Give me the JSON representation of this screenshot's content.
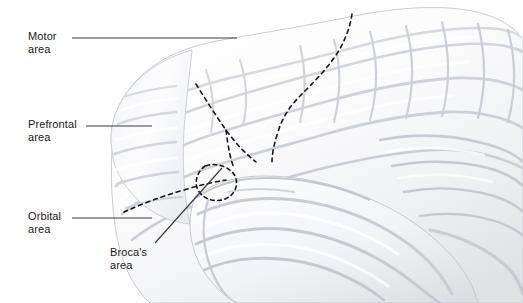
{
  "figure": {
    "background_color": "#ffffff",
    "width": 523,
    "height": 303
  },
  "labels": [
    {
      "id": "motor",
      "name": "motor-area",
      "line1": "Motor",
      "line2": "area",
      "text": "Motor\narea",
      "leader": {
        "type": "horizontal",
        "x1": 72,
        "y1": 38,
        "x2": 237,
        "y2": 38
      }
    },
    {
      "id": "prefrontal",
      "name": "prefrontal-area",
      "line1": "Prefrontal",
      "line2": "area",
      "text": "Prefrontal\narea",
      "leader": {
        "type": "horizontal",
        "x1": 86,
        "y1": 126,
        "x2": 152,
        "y2": 126
      }
    },
    {
      "id": "orbital",
      "name": "orbital-area",
      "line1": "Orbital",
      "line2": "area",
      "text": "Orbital\narea",
      "leader": {
        "type": "horizontal",
        "x1": 72,
        "y1": 218,
        "x2": 152,
        "y2": 218
      }
    },
    {
      "id": "brocas",
      "name": "brocas-area",
      "line1": "Broca's",
      "line2": "area",
      "text": "Broca's\narea",
      "leader": {
        "type": "diagonal",
        "x1": 155,
        "y1": 243,
        "x2": 222,
        "y2": 168
      }
    }
  ],
  "colors": {
    "leader_line": "#3a3a42",
    "boundary_dashed": "#15151a",
    "text": "#1a1a1a",
    "brain_fill": "#fbfbfc",
    "brain_outline": "#c9ccd2",
    "sulcus_light": "#d8dade",
    "sulcus_mid": "#c2c5cb",
    "shadow": "#b4b8bf"
  },
  "boundaries": [
    {
      "name": "central-sulcus",
      "style": "dashed",
      "description": "Dashed line separating motor area from posterior cortex, running from superior margin downward and anteriorly"
    },
    {
      "name": "prefrontal-motor-boundary",
      "style": "dashed",
      "description": "Dashed line separating prefrontal area from motor area"
    },
    {
      "name": "orbital-boundary",
      "style": "dashed",
      "description": "Dashed line along the inferior frontal margin separating orbital area"
    },
    {
      "name": "brocas-outline",
      "style": "dashed",
      "description": "Small dashed oval outlining Broca's area at the inferior frontal gyrus"
    }
  ]
}
